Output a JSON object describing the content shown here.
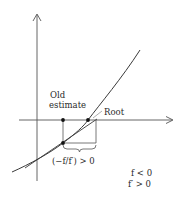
{
  "diagram": {
    "labels": {
      "old_line1": "Old",
      "old_line2": "estimate",
      "root": "Root",
      "step": "(−f/f′) > 0",
      "cond1": "f < 0",
      "cond2": "f′ > 0"
    },
    "colors": {
      "axis": "#555555",
      "curve": "#3a3a3a",
      "tangent": "#3a3a3a",
      "point": "#111111",
      "text": "#2a2a2a"
    },
    "points": {
      "old_estimate_axis": [
        63,
        120
      ],
      "old_estimate_curve": [
        63,
        143
      ],
      "root": [
        88,
        120
      ],
      "new_estimate": [
        96,
        120
      ]
    }
  }
}
